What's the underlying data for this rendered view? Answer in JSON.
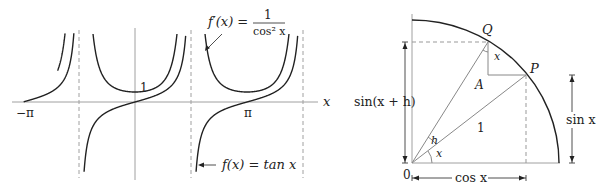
{
  "left_figure": {
    "title": "Graph of tan x and its derivative",
    "x_axis_label": "x",
    "tick_labels": {
      "neg_pi": "−π",
      "pi": "π",
      "one": "1"
    },
    "annotations": {
      "derivative_lhs": "f′(x) =",
      "derivative_num": "1",
      "derivative_den": "cos² x",
      "function": "f(x) = tan x"
    },
    "colors": {
      "curve": "#222222",
      "axis": "#999999",
      "asymptote": "#999999"
    }
  },
  "right_figure": {
    "title": "Unit circle derivation of sin",
    "labels": {
      "Q": "Q",
      "P": "P",
      "angle_x_at_Q": "x",
      "A": "A",
      "radius": "1",
      "h": "h",
      "x": "x",
      "origin": "0",
      "sin_x_plus_h": "sin(x + h)",
      "sin_x": "sin x",
      "cos_x": "cos x"
    }
  },
  "chart_data": {
    "type": "line",
    "title": "",
    "xlabel": "x",
    "ylabel": "",
    "x_ticks": [
      "−π",
      "π"
    ],
    "y_ticks": [
      "1"
    ],
    "xlim": [
      -3.3,
      4.1
    ],
    "asymptotes": [
      "−π/2",
      "π/2",
      "3π/2"
    ],
    "series": [
      {
        "name": "f(x) = tan x",
        "formula": "tan x"
      },
      {
        "name": "f′(x) = 1/cos² x",
        "formula": "1/cos^2 x"
      }
    ],
    "grid": false
  }
}
